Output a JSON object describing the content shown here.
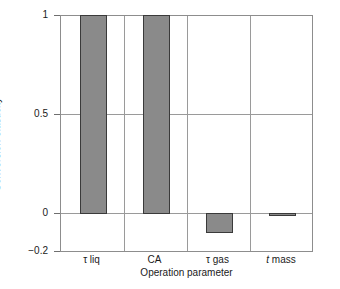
{
  "chart_data": {
    "type": "bar",
    "title": "",
    "xlabel": "Operation parameter",
    "ylabel": "Conversion elasticity",
    "categories": [
      "τ liq",
      "CA",
      "τ gas",
      "t mass"
    ],
    "values": [
      1.0,
      1.0,
      -0.1,
      -0.01
    ],
    "ylim": [
      -0.2,
      1.0
    ],
    "yticks": [
      1,
      0.5,
      0,
      -0.2
    ],
    "ytick_labels": [
      "1",
      "0.5",
      "0",
      "−0.2"
    ],
    "grid": "horizontal-at-yticks-and-vertical-category-separators",
    "legend": "none",
    "bar_color": "#8a8a8a",
    "bar_edge_color": "#3a3a3a",
    "axis_color": "#8d8d8d",
    "background": "#ffffff"
  },
  "category_labels": [
    {
      "symbol": "τ",
      "sub": "liq",
      "italic": false
    },
    {
      "symbol": "CA",
      "sub": "",
      "italic": false
    },
    {
      "symbol": "τ",
      "sub": "gas",
      "italic": false
    },
    {
      "symbol": "t",
      "sub": "mass",
      "italic": true
    }
  ]
}
